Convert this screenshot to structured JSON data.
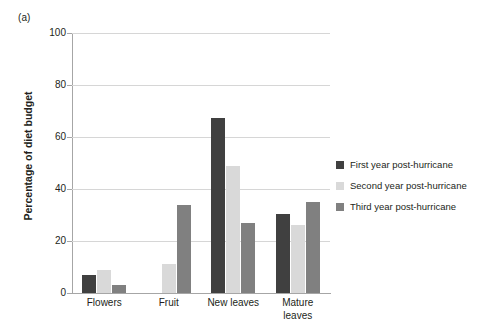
{
  "figure": {
    "panel_label": "(a)"
  },
  "chart_data": {
    "type": "bar",
    "title": "",
    "xlabel": "",
    "ylabel": "Percentage of diet budget",
    "ylim": [
      0,
      100
    ],
    "yticks": [
      0,
      20,
      40,
      60,
      80,
      100
    ],
    "ytick_labels": [
      "0",
      "20",
      "40",
      "60",
      "80",
      "100"
    ],
    "grid": "horizontal",
    "legend_position": "right",
    "categories": [
      "Flowers",
      "Fruit",
      "New leaves",
      "Mature leaves"
    ],
    "category_label_lines": [
      [
        "Flowers"
      ],
      [
        "Fruit"
      ],
      [
        "New leaves"
      ],
      [
        "Mature",
        "leaves"
      ]
    ],
    "series": [
      {
        "name": "First year post-hurricane",
        "color": "#404040",
        "values": [
          7,
          0,
          67.5,
          30.5
        ]
      },
      {
        "name": "Second year post-hurricane",
        "color": "#d9d9d9",
        "values": [
          9,
          11,
          49,
          26
        ]
      },
      {
        "name": "Third year post-hurricane",
        "color": "#808080",
        "values": [
          3,
          34,
          27,
          35
        ]
      }
    ]
  }
}
